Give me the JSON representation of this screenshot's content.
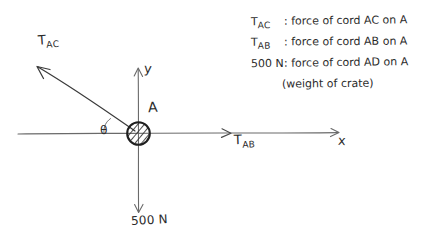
{
  "diagram": {
    "type": "free-body-diagram",
    "particle_label": "A",
    "axes": {
      "x_label": "x",
      "y_label": "y"
    },
    "angle_label": "θ",
    "forces": [
      {
        "symbol": "T",
        "subscript": "AC",
        "label_html": "T_AC",
        "direction": "up-left",
        "angle_deg_from_x_axis": 33
      },
      {
        "symbol": "T",
        "subscript": "AB",
        "label_html": "T_AB",
        "direction": "right",
        "angle_deg_from_x_axis": 0
      },
      {
        "magnitude": "500",
        "unit": "N",
        "label_html": "500 N",
        "direction": "down",
        "angle_deg_from_x_axis": -90
      }
    ],
    "force_labels": {
      "tac": "T",
      "tac_sub": "AC",
      "tab": "T",
      "tab_sub": "AB",
      "weight": "500 N"
    }
  },
  "legend": {
    "lines": [
      {
        "symbol": "T",
        "symbol_sub": "AC",
        "separator": ":",
        "description": "force of cord AC on A"
      },
      {
        "symbol": "T",
        "symbol_sub": "AB",
        "separator": ":",
        "description": "force of cord AB on A"
      },
      {
        "symbol": "500 N",
        "symbol_sub": "",
        "separator": ":",
        "description": "force of cord AD on A"
      },
      {
        "symbol": "",
        "symbol_sub": "",
        "separator": "",
        "description": "(weight of crate)"
      }
    ]
  },
  "colors": {
    "ink": "#2b2b2b",
    "line": "#555555",
    "background": "#ffffff"
  }
}
